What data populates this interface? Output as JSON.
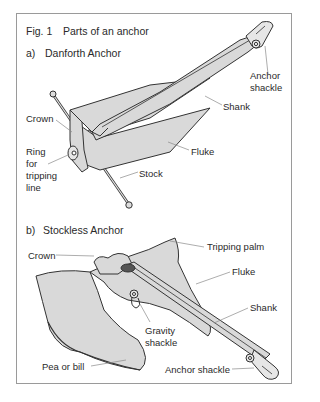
{
  "figure": {
    "title_num": "Fig. 1",
    "title_text": "Parts of an anchor"
  },
  "danforth": {
    "label_letter": "a)",
    "label_name": "Danforth Anchor",
    "parts": {
      "anchor_shackle_1": "Anchor",
      "anchor_shackle_2": "shackle",
      "shank": "Shank",
      "crown": "Crown",
      "ring_1": "Ring",
      "ring_2": "for",
      "ring_3": "tripping",
      "ring_4": "line",
      "fluke": "Fluke",
      "stock": "Stock"
    }
  },
  "stockless": {
    "label_letter": "b)",
    "label_name": "Stockless Anchor",
    "parts": {
      "tripping_palm": "Tripping palm",
      "crown": "Crown",
      "fluke": "Fluke",
      "shank": "Shank",
      "gravity_1": "Gravity",
      "gravity_2": "shackle",
      "pea": "Pea or bill",
      "anchor_shackle": "Anchor shackle"
    }
  },
  "colors": {
    "fill": "#d9d9d9",
    "stroke": "#333333",
    "leader": "#8a8a8a",
    "frame": "#9a9a9a"
  }
}
